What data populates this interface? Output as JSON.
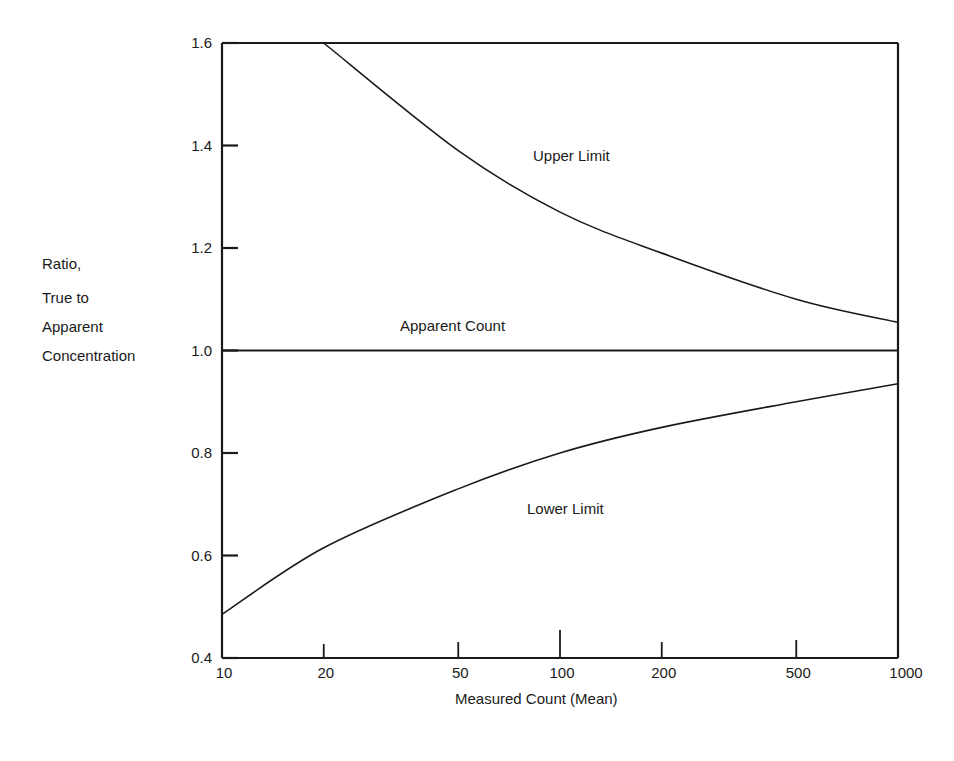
{
  "chart_data": {
    "type": "line",
    "title": "",
    "xlabel": "Measured Count (Mean)",
    "ylabel": "Ratio, True to Apparent Concentration",
    "ylabel_lines": [
      "Ratio,",
      "True to",
      "Apparent",
      "Concentration"
    ],
    "xscale": "log",
    "xlim": [
      10,
      1000
    ],
    "ylim": [
      0.4,
      1.6
    ],
    "x_ticks": [
      "10",
      "20",
      "50",
      "100",
      "200",
      "500",
      "1000"
    ],
    "y_ticks": [
      "1.6",
      "1.4",
      "1.2",
      "1.0",
      "0.8",
      "0.6",
      "0.4"
    ],
    "grid": false,
    "legend": "none (inline curve labels)",
    "x": [
      10,
      20,
      50,
      100,
      200,
      500,
      1000
    ],
    "series": [
      {
        "name": "Upper Limit",
        "x": [
          20,
          50,
          100,
          200,
          500,
          1000
        ],
        "values": [
          1.6,
          1.39,
          1.27,
          1.19,
          1.1,
          1.055
        ]
      },
      {
        "name": "Apparent Count",
        "x": [
          10,
          1000
        ],
        "values": [
          1.0,
          1.0
        ]
      },
      {
        "name": "Lower Limit",
        "x": [
          10,
          20,
          50,
          100,
          200,
          500,
          1000
        ],
        "values": [
          0.485,
          0.615,
          0.73,
          0.8,
          0.85,
          0.9,
          0.935
        ]
      }
    ],
    "annotations": [
      "Upper Limit",
      "Apparent Count",
      "Lower Limit"
    ]
  }
}
